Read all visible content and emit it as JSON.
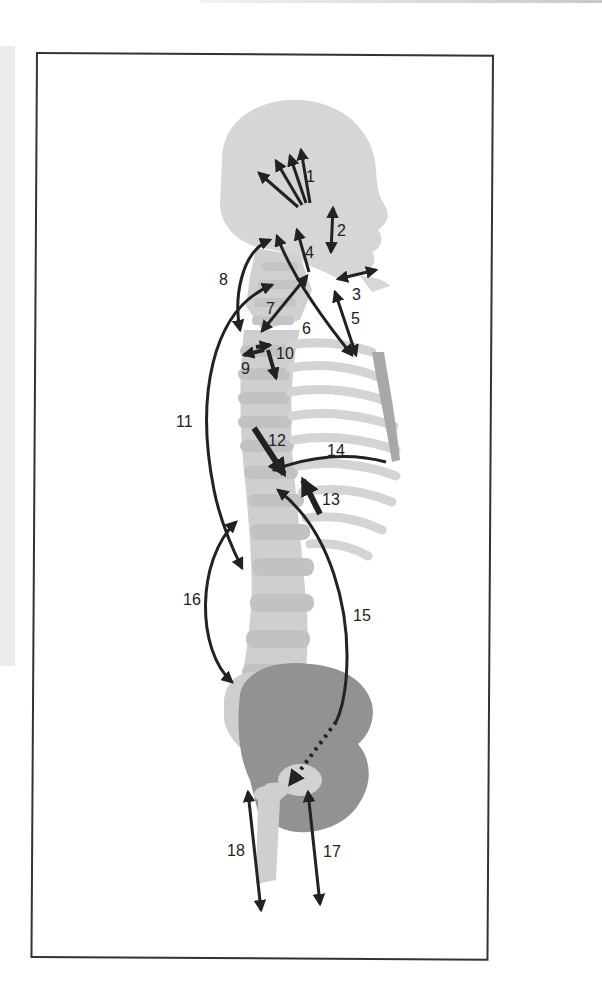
{
  "figure": {
    "type": "anatomical force diagram",
    "colors": {
      "frame": "#333333",
      "arrow": "#222222",
      "bone_light": "#d9d9d9",
      "bone_mid": "#c8c8c8",
      "pelvis_dark": "#8f8f8f",
      "sternum": "#a8a8a8"
    },
    "labels": [
      {
        "id": 1,
        "text": "1"
      },
      {
        "id": 2,
        "text": "2"
      },
      {
        "id": 3,
        "text": "3"
      },
      {
        "id": 4,
        "text": "4"
      },
      {
        "id": 5,
        "text": "5"
      },
      {
        "id": 6,
        "text": "6"
      },
      {
        "id": 7,
        "text": "7"
      },
      {
        "id": 8,
        "text": "8"
      },
      {
        "id": 9,
        "text": "9"
      },
      {
        "id": 10,
        "text": "10"
      },
      {
        "id": 11,
        "text": "11"
      },
      {
        "id": 12,
        "text": "12"
      },
      {
        "id": 13,
        "text": "13"
      },
      {
        "id": 14,
        "text": "14"
      },
      {
        "id": 15,
        "text": "15"
      },
      {
        "id": 16,
        "text": "16"
      },
      {
        "id": 17,
        "text": "17"
      },
      {
        "id": 18,
        "text": "18"
      }
    ]
  }
}
